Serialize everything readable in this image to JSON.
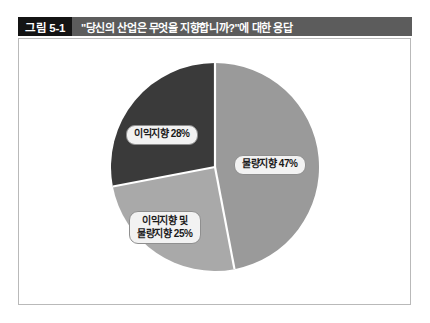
{
  "caption": {
    "figure_number": "그림 5-1",
    "title": "\"당신의 산업은 무엇을 지향합니까?\"에 대한 응답"
  },
  "chart_data": {
    "type": "pie",
    "title": "\"당신의 산업은 무엇을 지향합니까?\"에 대한 응답",
    "xlabel": "",
    "ylabel": "",
    "legend_position": "none",
    "grid": false,
    "total": 100,
    "unit": "%",
    "categories": [
      "물량지향",
      "이익지향 및 물량지향",
      "이익지향"
    ],
    "values": [
      47,
      25,
      28
    ],
    "start_angle_deg": 0,
    "direction": "clockwise",
    "slices": [
      {
        "name": "물량지향",
        "label": "물량지향 47%",
        "label_lines": [
          "물량지향 47%"
        ],
        "value": 47,
        "color": "#9a9a9a",
        "start_deg": 0,
        "end_deg": 169.2
      },
      {
        "name": "이익지향 및 물량지향",
        "label": "이익지향 및 물량지향 25%",
        "label_lines": [
          "이익지향 및",
          "물량지향 25%"
        ],
        "value": 25,
        "color": "#a9a9a9",
        "start_deg": 169.2,
        "end_deg": 259.2
      },
      {
        "name": "이익지향",
        "label": "이익지향 28%",
        "label_lines": [
          "이익지향 28%"
        ],
        "value": 28,
        "color": "#3a3a3a",
        "start_deg": 259.2,
        "end_deg": 360
      }
    ],
    "colors": {
      "slice_volume": "#9a9a9a",
      "slice_both": "#a9a9a9",
      "slice_profit": "#3a3a3a",
      "slice_separator": "#ffffff",
      "caption_bar": "#5c5c5c",
      "figure_number_bg": "#141414",
      "frame_border": "#b9b9b9",
      "label_bg": "#f2f2f2",
      "label_border": "#8f8f8f"
    }
  }
}
